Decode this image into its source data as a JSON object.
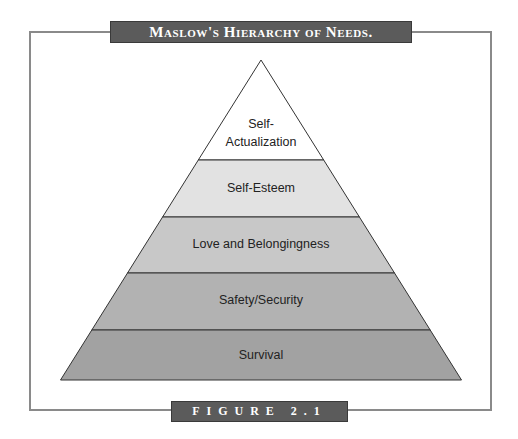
{
  "title": "Maslow's Hierarchy of Needs.",
  "figure_label": "FIGURE 2.1",
  "levels": [
    {
      "label_line1": "Self-",
      "label_line2": "Actualization",
      "color": "#ffffff"
    },
    {
      "label": "Self-Esteem",
      "color": "#e2e2e2"
    },
    {
      "label": "Love and Belongingness",
      "color": "#c8c8c8"
    },
    {
      "label": "Safety/Security",
      "color": "#b2b2b2"
    },
    {
      "label": "Survival",
      "color": "#a2a2a2"
    }
  ]
}
